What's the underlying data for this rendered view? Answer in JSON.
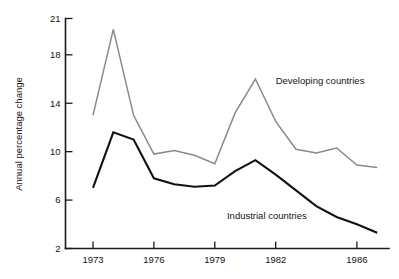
{
  "chart_data": {
    "type": "line",
    "title": "",
    "xlabel": "",
    "ylabel": "Annual percentage change",
    "xlim": [
      1973,
      1987
    ],
    "ylim": [
      2,
      21
    ],
    "grid": false,
    "legend_position": "inline-annotations",
    "x": [
      1973,
      1974,
      1975,
      1976,
      1977,
      1978,
      1979,
      1980,
      1981,
      1982,
      1983,
      1984,
      1985,
      1986,
      1987
    ],
    "x_tick_labels": [
      "1973",
      "1976",
      "1979",
      "1982",
      "1986"
    ],
    "x_ticks": [
      1973,
      1976,
      1979,
      1982,
      1986
    ],
    "y_ticks": [
      2,
      6,
      10,
      14,
      18,
      21
    ],
    "y_tick_labels": [
      "2",
      "6",
      "10",
      "14",
      "18",
      "21"
    ],
    "series": [
      {
        "name": "Developing countries",
        "color": "#8a8a8a",
        "label_x": 1982.0,
        "label_y": 15.6,
        "values": [
          13.0,
          20.1,
          13.0,
          9.8,
          10.1,
          9.7,
          9.0,
          13.2,
          16.0,
          12.5,
          10.2,
          9.9,
          10.3,
          8.9,
          8.7
        ]
      },
      {
        "name": "Industrial countries",
        "color": "#111111",
        "label_x": 1979.6,
        "label_y": 4.4,
        "values": [
          7.0,
          11.6,
          11.0,
          7.8,
          7.3,
          7.1,
          7.2,
          8.4,
          9.3,
          8.1,
          6.8,
          5.5,
          4.6,
          4.0,
          3.3
        ]
      }
    ]
  },
  "axis": {
    "y_title": "Annual percentage change"
  }
}
